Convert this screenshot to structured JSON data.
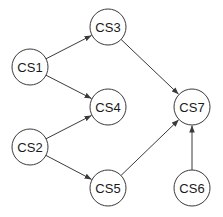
{
  "diagram": {
    "type": "directed-graph",
    "colors": {
      "stroke": "#3a3a3a",
      "fill": "#ffffff",
      "text": "#1a1a1a"
    },
    "radius": 18,
    "nodes": [
      {
        "id": "CS1",
        "label": "CS1",
        "x": 30,
        "y": 67
      },
      {
        "id": "CS2",
        "label": "CS2",
        "x": 30,
        "y": 147
      },
      {
        "id": "CS3",
        "label": "CS3",
        "x": 108,
        "y": 27
      },
      {
        "id": "CS4",
        "label": "CS4",
        "x": 108,
        "y": 107
      },
      {
        "id": "CS5",
        "label": "CS5",
        "x": 108,
        "y": 188
      },
      {
        "id": "CS6",
        "label": "CS6",
        "x": 192,
        "y": 188
      },
      {
        "id": "CS7",
        "label": "CS7",
        "x": 192,
        "y": 107
      }
    ],
    "edges": [
      {
        "from": "CS1",
        "to": "CS3"
      },
      {
        "from": "CS1",
        "to": "CS4"
      },
      {
        "from": "CS2",
        "to": "CS4"
      },
      {
        "from": "CS2",
        "to": "CS5"
      },
      {
        "from": "CS3",
        "to": "CS7"
      },
      {
        "from": "CS5",
        "to": "CS7"
      },
      {
        "from": "CS6",
        "to": "CS7"
      }
    ]
  }
}
